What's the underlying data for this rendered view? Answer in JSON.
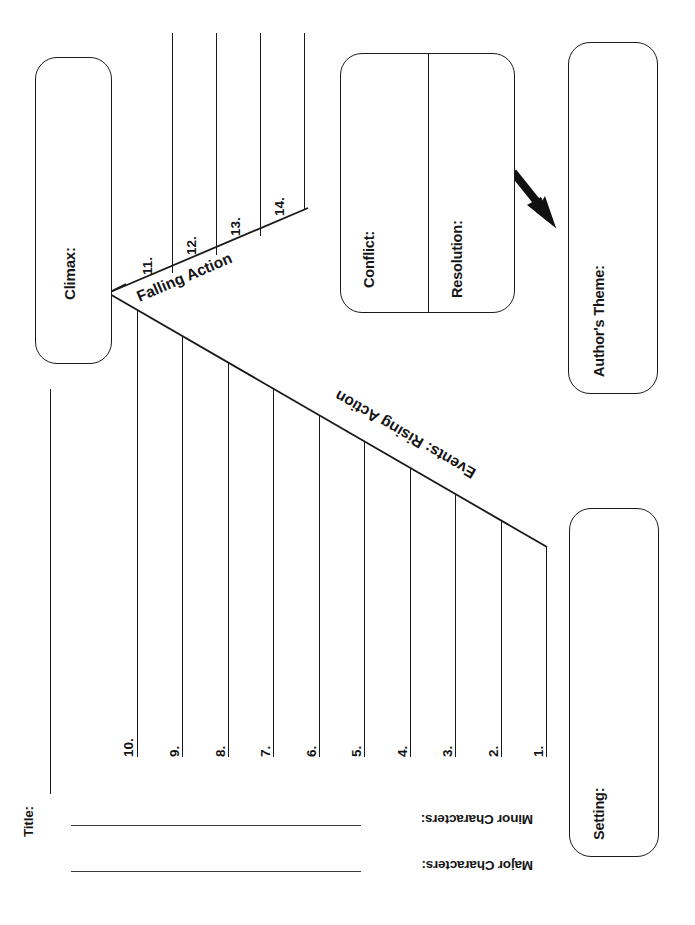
{
  "document": {
    "type": "plot-diagram-worksheet",
    "orientation": "landscape-content-on-portrait-page",
    "background_color": "#ffffff",
    "line_color": "#1a1a1a",
    "text_color": "#141414"
  },
  "boxes": {
    "climax": {
      "label": "Climax:"
    },
    "conflict": {
      "label": "Conflict:"
    },
    "resolution": {
      "label": "Resolution:"
    },
    "authors_theme": {
      "label": "Author's Theme:"
    },
    "setting": {
      "label": "Setting:"
    }
  },
  "diagonals": {
    "rising": {
      "label": "Events: Rising Action"
    },
    "falling": {
      "label": "Falling Action"
    }
  },
  "rising_numbers": [
    "1.",
    "2.",
    "3.",
    "4.",
    "5.",
    "6.",
    "7.",
    "8.",
    "9.",
    "10."
  ],
  "falling_numbers": [
    "11.",
    "12.",
    "13.",
    "14."
  ],
  "fields": {
    "title": "Title:",
    "major_characters": "Major Characters:",
    "minor_characters": "Minor Characters:"
  },
  "arrow": {
    "name": "resolution-to-theme-arrow",
    "direction": "down-right",
    "color": "#111111"
  },
  "header_fragment": ""
}
